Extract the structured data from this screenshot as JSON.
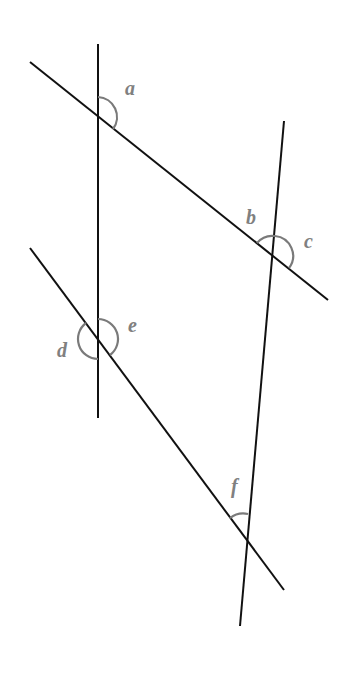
{
  "diagram": {
    "type": "angle-diagram",
    "lines": [
      {
        "id": "vertical-left",
        "x1": 98,
        "y1": 44,
        "x2": 98,
        "y2": 418
      },
      {
        "id": "slant-right",
        "x1": 284,
        "y1": 121,
        "x2": 240,
        "y2": 626
      },
      {
        "id": "diagonal-top",
        "x1": 30,
        "y1": 62,
        "x2": 328,
        "y2": 300
      },
      {
        "id": "diagonal-bottom",
        "x1": 30,
        "y1": 248,
        "x2": 284,
        "y2": 590
      }
    ],
    "angles": [
      {
        "label": "a",
        "x": 125,
        "y": 95
      },
      {
        "label": "b",
        "x": 246,
        "y": 224
      },
      {
        "label": "c",
        "x": 304,
        "y": 248
      },
      {
        "label": "d",
        "x": 57,
        "y": 357
      },
      {
        "label": "e",
        "x": 128,
        "y": 332
      },
      {
        "label": "f",
        "x": 231,
        "y": 493
      }
    ],
    "colors": {
      "line": "#111111",
      "arc": "#7a7a7a",
      "label": "#808080"
    }
  }
}
